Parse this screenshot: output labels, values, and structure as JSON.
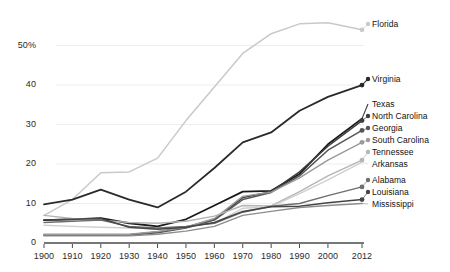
{
  "chart_data": {
    "type": "line",
    "title": "",
    "subtitle": "",
    "xlabel": "",
    "ylabel": "",
    "xlim": [
      1900,
      2012
    ],
    "ylim": [
      0,
      58
    ],
    "grid": true,
    "legend_position": "right-inline-labels",
    "x": [
      1900,
      1910,
      1920,
      1930,
      1940,
      1950,
      1960,
      1970,
      1980,
      1990,
      2000,
      2012
    ],
    "xtick_labels": [
      "1900",
      "1910",
      "1920",
      "1930",
      "1940",
      "1950",
      "1960",
      "1970",
      "1980",
      "1990",
      "2000",
      "2012"
    ],
    "ytick_values": [
      0,
      10,
      20,
      30,
      40,
      50
    ],
    "ytick_labels": [
      "0",
      "10",
      "20",
      "30",
      "40",
      "50%"
    ],
    "series": [
      {
        "name": "Florida",
        "color": "#c9c9c9",
        "width": 1.5,
        "values": [
          7.0,
          11.0,
          17.8,
          18.0,
          21.5,
          31.0,
          39.5,
          48.0,
          53.0,
          55.5,
          55.8,
          54.0
        ]
      },
      {
        "name": "Virginia",
        "color": "#2a2a2a",
        "width": 1.8,
        "values": [
          9.8,
          11.0,
          13.5,
          11.0,
          9.0,
          13.0,
          19.0,
          25.5,
          28.0,
          33.5,
          37.0,
          40.0
        ]
      },
      {
        "name": "Texas",
        "color": "#1a1a1a",
        "width": 1.8,
        "values": [
          5.8,
          6.0,
          6.3,
          5.0,
          4.2,
          6.0,
          9.5,
          13.0,
          13.2,
          17.5,
          25.0,
          31.5
        ]
      },
      {
        "name": "North Carolina",
        "color": "#3d3d3d",
        "width": 1.5,
        "values": [
          2.0,
          2.0,
          2.0,
          2.1,
          2.8,
          4.0,
          6.0,
          11.5,
          13.0,
          18.0,
          24.5,
          31.0
        ]
      },
      {
        "name": "Georgia",
        "color": "#555555",
        "width": 1.5,
        "values": [
          2.0,
          2.0,
          2.0,
          2.0,
          2.6,
          3.8,
          5.8,
          11.0,
          12.8,
          17.0,
          23.5,
          28.5
        ]
      },
      {
        "name": "South Carolina",
        "color": "#9a9a9a",
        "width": 1.4,
        "values": [
          2.2,
          2.2,
          2.2,
          2.2,
          2.9,
          4.0,
          6.2,
          11.8,
          12.9,
          16.5,
          21.0,
          25.5
        ]
      },
      {
        "name": "Tennessee",
        "color": "#b5b5b5",
        "width": 1.4,
        "values": [
          7.0,
          6.2,
          5.8,
          5.2,
          5.0,
          5.5,
          6.8,
          9.5,
          9.4,
          13.0,
          17.0,
          21.0
        ]
      },
      {
        "name": "Arkansas",
        "color": "#cfcfcf",
        "width": 1.4,
        "values": [
          4.5,
          4.2,
          4.0,
          3.8,
          3.6,
          4.2,
          5.0,
          8.8,
          9.2,
          12.5,
          16.0,
          20.5
        ]
      },
      {
        "name": "Alabama",
        "color": "#6e6e6e",
        "width": 1.4,
        "values": [
          5.2,
          5.5,
          5.8,
          4.2,
          3.8,
          4.2,
          5.0,
          7.8,
          9.3,
          10.0,
          12.0,
          14.2
        ]
      },
      {
        "name": "Louisiana",
        "color": "#454545",
        "width": 1.5,
        "values": [
          5.8,
          6.0,
          6.2,
          4.0,
          3.5,
          4.0,
          5.2,
          8.0,
          9.2,
          9.3,
          10.2,
          11.0
        ]
      },
      {
        "name": "Mississippi",
        "color": "#8d8d8d",
        "width": 1.4,
        "values": [
          1.8,
          1.8,
          1.8,
          1.8,
          2.2,
          3.0,
          4.2,
          7.0,
          8.0,
          9.0,
          9.5,
          10.0
        ]
      }
    ],
    "legend_labels": [
      {
        "name": "Florida",
        "marker": true
      },
      {
        "name": "Virginia",
        "marker": true
      },
      {
        "name": "Texas",
        "marker": false
      },
      {
        "name": "North Carolina",
        "marker": true
      },
      {
        "name": "Georgia",
        "marker": true
      },
      {
        "name": "South Carolina",
        "marker": true
      },
      {
        "name": "Tennessee",
        "marker": true
      },
      {
        "name": "Arkansas",
        "marker": false
      },
      {
        "name": "Alabama",
        "marker": true
      },
      {
        "name": "Louisiana",
        "marker": true
      },
      {
        "name": "Mississippi",
        "marker": false
      }
    ],
    "colors": {
      "gridline": "#ededed",
      "axis": "#4a4a4a",
      "text": "#1b1b1b",
      "background": "#ffffff"
    }
  }
}
